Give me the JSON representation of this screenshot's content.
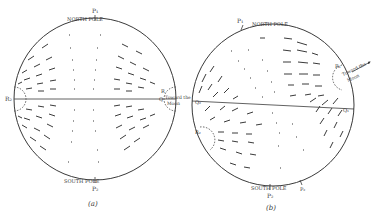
{
  "figure": {
    "panels": [
      {
        "id": "a",
        "caption": "(a)",
        "top_label": "NORTH POLE",
        "top_point": "P₁",
        "bottom_label": "SOUTH POLE",
        "bottom_point": "P₂",
        "left_point": "R₂",
        "right_point_upper": "R",
        "right_point_lower": "Q",
        "direction_label_1": "Toward the",
        "direction_label_2": "Moon",
        "left_equator_label": "R₂",
        "right_equator_label": "Q₁"
      },
      {
        "id": "b",
        "caption": "(b)",
        "top_label": "NORTH POLE",
        "top_point": "P₁",
        "top_tilt_point": "P₁",
        "bottom_label": "SOUTH POLE",
        "bottom_point": "P₂",
        "bottom_tilt_point": "P₂",
        "left_point": "Q₂",
        "left_lower_point": "R₂",
        "right_point": "Q₁",
        "right_upper_point": "R₁",
        "direction_label_1": "Toward the",
        "direction_label_2": "Moon"
      }
    ],
    "colors": {
      "ink": "#3a3a3a",
      "background": "#ffffff"
    }
  }
}
